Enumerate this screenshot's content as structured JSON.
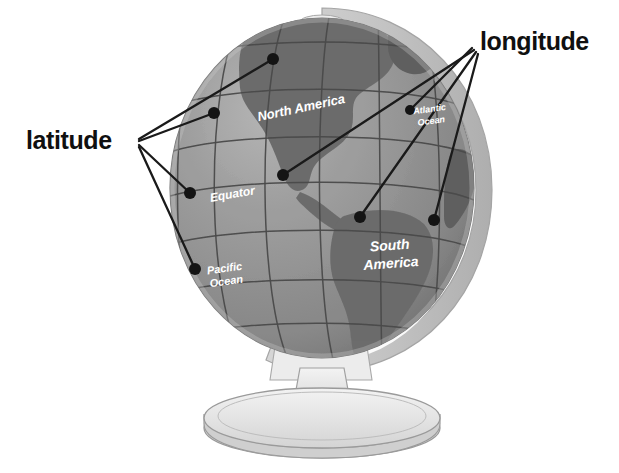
{
  "figure": {
    "type": "diagram",
    "background_color": "#ffffff"
  },
  "callouts": [
    {
      "id": "longitude",
      "label": "longitude",
      "side": "right",
      "label_position": {
        "x": 480,
        "y": 27
      },
      "anchor": {
        "x": 472,
        "y": 52
      },
      "leader_dots": [
        {
          "x": 283,
          "y": 175
        },
        {
          "x": 360,
          "y": 217
        },
        {
          "x": 434,
          "y": 220
        },
        {
          "x": 410,
          "y": 110
        }
      ]
    },
    {
      "id": "latitude",
      "label": "latitude",
      "side": "left",
      "label_position": {
        "x": 26,
        "y": 126
      },
      "anchor": {
        "x": 139,
        "y": 142
      },
      "leader_dots": [
        {
          "x": 273,
          "y": 59
        },
        {
          "x": 214,
          "y": 113
        },
        {
          "x": 190,
          "y": 193
        },
        {
          "x": 195,
          "y": 269
        }
      ]
    }
  ],
  "globe_labels": [
    {
      "id": "north-america",
      "text": "North America",
      "lines": [
        "North America"
      ],
      "x": 302,
      "y": 112,
      "rotation": -12,
      "color": "#ffffff"
    },
    {
      "id": "atlantic-ocean",
      "text": "Atlantic Ocean",
      "lines": [
        "Atlantic",
        "Ocean"
      ],
      "x": 430,
      "y": 118,
      "rotation": -8,
      "color": "#ffffff"
    },
    {
      "id": "equator",
      "text": "Equator",
      "lines": [
        "Equator"
      ],
      "x": 233,
      "y": 196,
      "rotation": -10,
      "color": "#ffffff"
    },
    {
      "id": "pacific-ocean",
      "text": "Pacific Ocean",
      "lines": [
        "Pacific",
        "Ocean"
      ],
      "x": 225,
      "y": 272,
      "rotation": -8,
      "color": "#ffffff"
    },
    {
      "id": "south-america",
      "text": "South America",
      "lines": [
        "South",
        "America"
      ],
      "x": 390,
      "y": 250,
      "rotation": -6,
      "color": "#ffffff"
    }
  ],
  "colors": {
    "ocean": "#8e8e8e",
    "ocean_light": "#a9a9a9",
    "land": "#6f6f6f",
    "land_dark": "#5c5c5c",
    "gridline": "#4a4a4a",
    "ring": "#c9c9c9",
    "ring_shadow": "#b5b5b5",
    "stand": "#e8e8e8",
    "stand_edge": "#9a9a9a",
    "callout_text": "#101010",
    "leader_line": "#1a1a1a",
    "dot": "#141414",
    "label_text": "#ffffff"
  },
  "grid": {
    "latitude_count": 7,
    "longitude_count": 7,
    "equator_labeled": true
  }
}
